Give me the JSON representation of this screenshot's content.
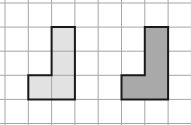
{
  "grid": {
    "columns": 8,
    "rows": 5,
    "origin_x": 5,
    "origin_y": 3,
    "cell_w": 23.3,
    "cell_h": 24.1,
    "line_color": "#a6a6a6",
    "background": "#ffffff"
  },
  "shapes": [
    {
      "name": "light-l-shape",
      "fill": "#e2e2e2",
      "stroke": "#1a1a1a",
      "cells": [
        [
          2,
          1
        ],
        [
          2,
          2
        ],
        [
          2,
          3
        ],
        [
          1,
          3
        ]
      ],
      "outline": [
        [
          2,
          1
        ],
        [
          3,
          1
        ],
        [
          3,
          4
        ],
        [
          1,
          4
        ],
        [
          1,
          3
        ],
        [
          2,
          3
        ]
      ]
    },
    {
      "name": "dark-l-shape",
      "fill": "#a9a9a9",
      "stroke": "#1a1a1a",
      "cells": [
        [
          6,
          1
        ],
        [
          6,
          2
        ],
        [
          6,
          3
        ],
        [
          5,
          3
        ]
      ],
      "outline": [
        [
          6,
          1
        ],
        [
          7,
          1
        ],
        [
          7,
          4
        ],
        [
          5,
          4
        ],
        [
          5,
          3
        ],
        [
          6,
          3
        ]
      ]
    }
  ]
}
